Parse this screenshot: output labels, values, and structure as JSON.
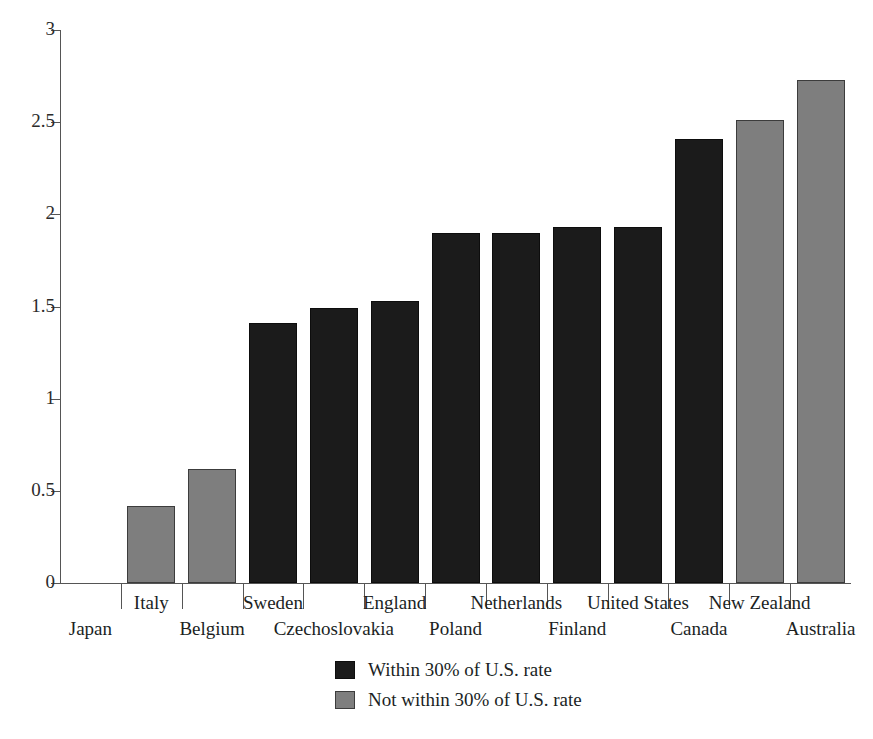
{
  "chart_data": {
    "type": "bar",
    "title": "",
    "subtitle": "",
    "xlabel": "",
    "ylabel": "",
    "ylim": [
      0,
      3
    ],
    "yticks": [
      "0",
      "0.5",
      "1",
      "1.5",
      "2",
      "2.5",
      "3"
    ],
    "ytick_values": [
      0,
      0.5,
      1,
      1.5,
      2,
      2.5,
      3
    ],
    "grid": false,
    "legend_position": "bottom-center",
    "categories": [
      "Japan",
      "Italy",
      "Belgium",
      "Sweden",
      "Czechoslovakia",
      "England",
      "Poland",
      "Netherlands",
      "Finland",
      "United States",
      "Canada",
      "New Zealand",
      "Australia"
    ],
    "values": [
      0,
      0.42,
      0.62,
      1.41,
      1.49,
      1.53,
      1.9,
      1.9,
      1.93,
      1.93,
      2.41,
      2.51,
      2.73
    ],
    "bar_groups": [
      "not-within",
      "not-within",
      "not-within",
      "within",
      "within",
      "within",
      "within",
      "within",
      "within",
      "within",
      "within",
      "not-within",
      "not-within"
    ],
    "legend": [
      {
        "key": "within",
        "label": "Within 30% of U.S. rate",
        "color": "#1b1b1b"
      },
      {
        "key": "not-within",
        "label": "Not within 30% of U.S. rate",
        "color": "#7e7e7e"
      }
    ],
    "colors": {
      "within": "#1b1b1b",
      "not_within": "#7e7e7e",
      "axis": "#555555",
      "text": "#201f1f",
      "background": "#ffffff"
    }
  }
}
